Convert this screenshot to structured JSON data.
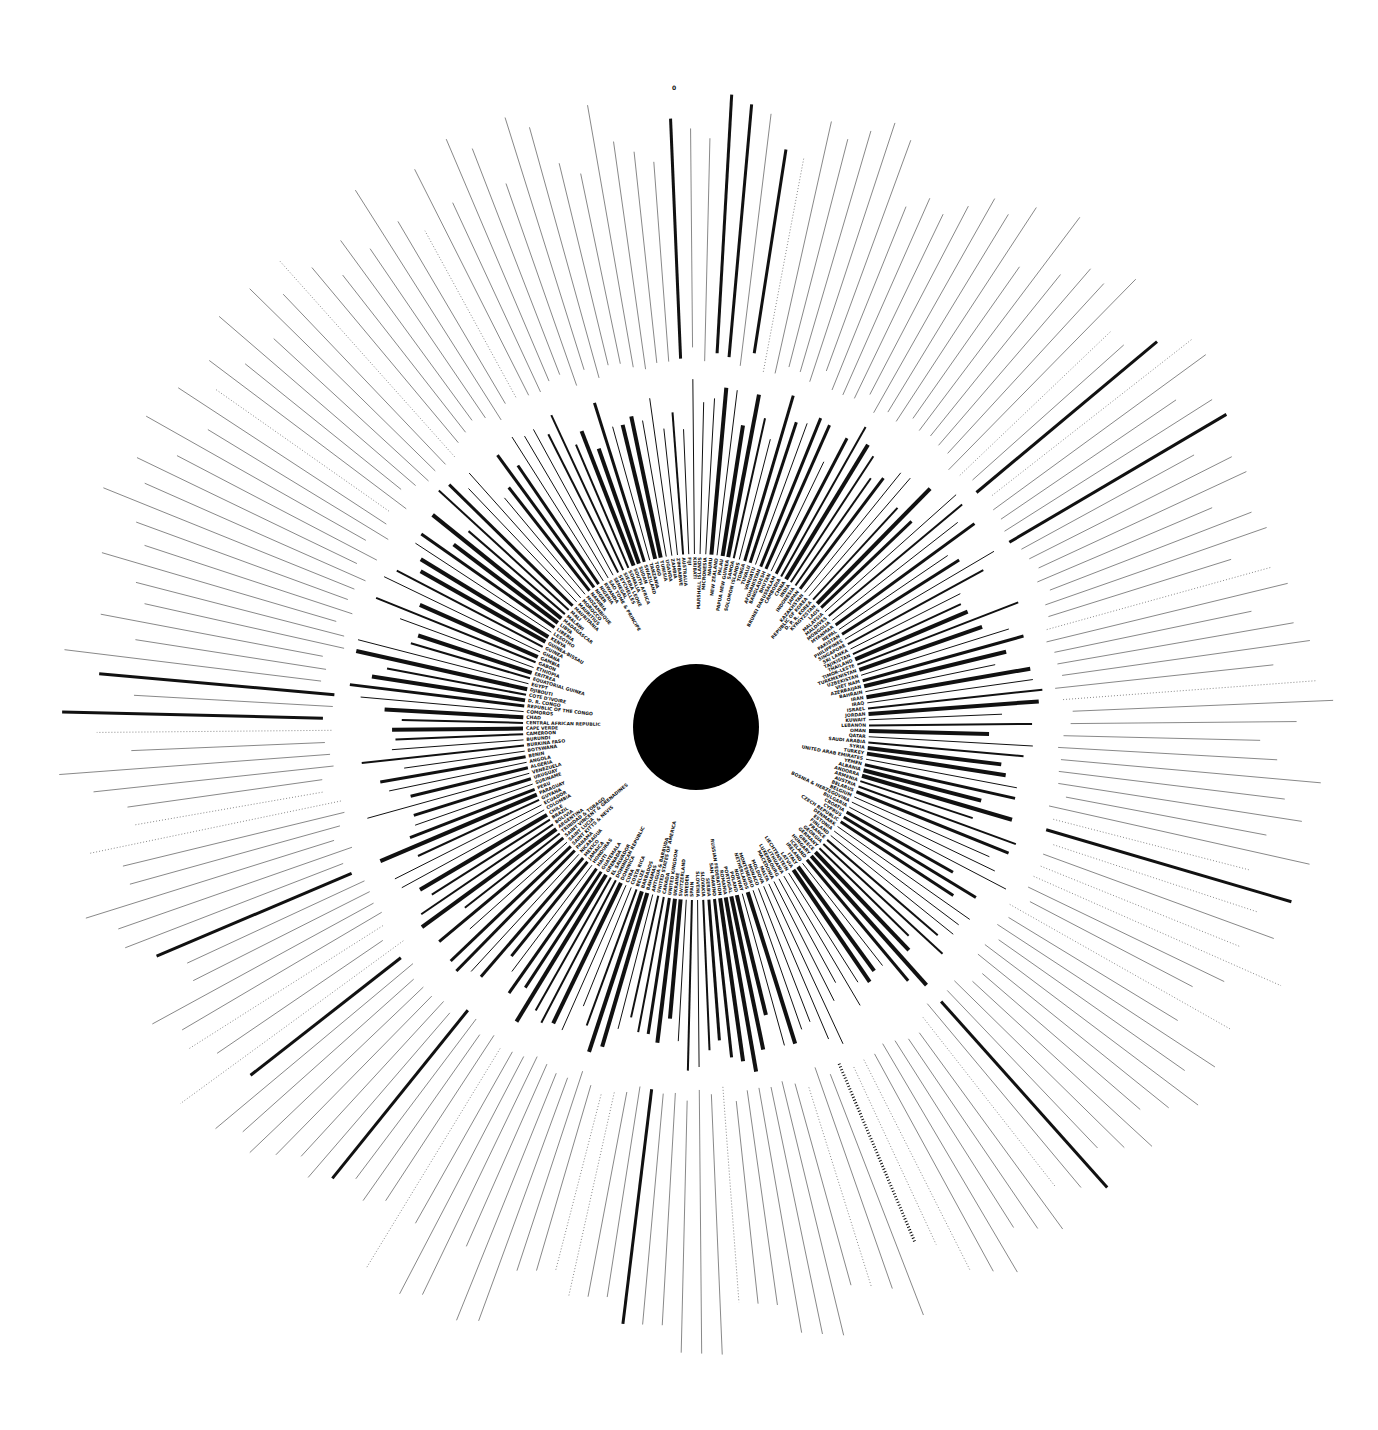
{
  "chart_data": {
    "type": "radial-bar",
    "title": "",
    "center": {
      "x": 696,
      "y": 727
    },
    "center_dot_radius": 63,
    "label_radius": 165,
    "inner_ring_radius": 350,
    "outer_radius": 640,
    "zero_label": "0",
    "colors": {
      "bar": "#111111",
      "thin": "#555555",
      "background": "#ffffff"
    },
    "regions": [
      {
        "name": "Asia-Pacific (top)",
        "countries": [
          "SAMOA",
          "SOLOMON ISLANDS",
          "TONGA",
          "TUVALU",
          "VANUATU",
          "AFGHANISTAN",
          "BANGLADESH",
          "BHUTAN",
          "BRUNEI DARUSSALAM",
          "CAMBODIA",
          "CHINA",
          "INDIA",
          "INDONESIA",
          "JAPAN",
          "KAZAKHSTAN",
          "REPUBLIC OF KOREA",
          "D. P. R. KOREA",
          "KYRGYZSTAN",
          "LAOS",
          "MALAYSIA",
          "MALDIVES",
          "MONGOLIA",
          "MYANMAR",
          "NEPAL",
          "PAKISTAN",
          "PHILIPPINES",
          "SINGAPORE",
          "SRI LANKA",
          "TAJIKISTAN",
          "THAILAND",
          "TIMOR-LESTE",
          "TURKMENISTAN",
          "UZBEKISTAN",
          "VIET NAM"
        ]
      },
      {
        "name": "Middle East",
        "countries": [
          "AZERBAIJAN",
          "BAHRAIN",
          "IRAN",
          "IRAQ",
          "ISRAEL",
          "JORDAN",
          "KUWAIT",
          "LEBANON",
          "OMAN",
          "QATAR",
          "SAUDI ARABIA",
          "SYRIA",
          "TURKEY",
          "UNITED ARAB EMIRATES",
          "YEMEN"
        ]
      },
      {
        "name": "Europe",
        "countries": [
          "ALBANIA",
          "ANDORRA",
          "ARMENIA",
          "AUSTRIA",
          "BELARUS",
          "BELGIUM",
          "BOSNIA & HERZEGOVINA",
          "BULGARIA",
          "CROATIA",
          "CYPRUS",
          "CZECH REPUBLIC",
          "DENMARK",
          "ESTONIA",
          "FINLAND",
          "FRANCE",
          "GEORGIA",
          "GERMANY",
          "GREECE",
          "HUNGARY",
          "ICELAND",
          "IRELAND",
          "ITALY",
          "LATVIA",
          "LIECHTENSTEIN",
          "LITHUANIA",
          "LUXEMBOURG",
          "MACEDONIA",
          "MALTA",
          "MOLDOVA",
          "MONACO",
          "MONTENEGRO",
          "NETHERLANDS",
          "NORWAY",
          "POLAND",
          "PORTUGAL",
          "ROMANIA",
          "RUSSIAN FEDERATION",
          "SAN MARINO",
          "SERBIA",
          "SLOVAKIA",
          "SLOVENIA",
          "SPAIN",
          "SWEDEN",
          "SWITZERLAND",
          "UKRAINE",
          "UNITED KINGDOM"
        ]
      },
      {
        "name": "Americas",
        "countries": [
          "CANADA",
          "UNITED STATES OF AMERICA",
          "ANTIGUA & BARBUDA",
          "BAHAMAS",
          "BARBADOS",
          "BELIZE",
          "COSTA RICA",
          "CUBA",
          "DOMINICA",
          "DOMINICAN REPUBLIC",
          "EL SALVADOR",
          "GRENADA",
          "GUATEMALA",
          "HAITI",
          "HONDURAS",
          "JAMAICA",
          "MEXICO",
          "NICARAGUA",
          "PANAMA",
          "SAINT KITTS & NEVIS",
          "SAINT LUCIA",
          "SAINT VINCENT & GRENADINES",
          "TRINIDAD & TOBAGO",
          "ARGENTINA",
          "BOLIVIA",
          "BRAZIL",
          "CHILE",
          "COLOMBIA",
          "ECUADOR",
          "GUYANA",
          "PARAGUAY",
          "PERU",
          "SURINAME",
          "URUGUAY",
          "VENEZUELA"
        ]
      },
      {
        "name": "Africa",
        "countries": [
          "ALGERIA",
          "ANGOLA",
          "BENIN",
          "BOTSWANA",
          "BURKINA FASO",
          "BURUNDI",
          "CAMEROON",
          "CAPE VERDE",
          "CENTRAL AFRICAN REPUBLIC",
          "CHAD",
          "COMOROS",
          "REPUBLIC OF THE CONGO",
          "D. R. CONGO",
          "COTE D'IVOIRE",
          "DJIBOUTI",
          "EGYPT",
          "EQUATORIAL GUINEA",
          "ERITREA",
          "ETHIOPIA",
          "GABON",
          "GAMBIA",
          "GHANA",
          "GUINEA",
          "GUINEA-BISSAU",
          "KENYA",
          "LESOTHO",
          "LIBERIA",
          "LIBYA",
          "MADAGASCAR",
          "MALAWI",
          "MALI",
          "MAURITANIA",
          "MAURITIUS",
          "MOROCCO",
          "MOZAMBIQUE",
          "NAMIBIA",
          "NIGER",
          "NIGERIA",
          "RWANDA",
          "SAO TOME & PRINCIPE",
          "SENEGAL",
          "SEYCHELLES",
          "SIERRA LEONE",
          "SOMALIA",
          "SOUTH AFRICA",
          "SUDAN",
          "SWAZILAND",
          "TANZANIA",
          "TOGO",
          "TUNISIA",
          "UGANDA",
          "ZAMBIA",
          "ZIMBABWE"
        ]
      },
      {
        "name": "Oceania",
        "countries": [
          "AUSTRALIA",
          "FIJI",
          "KIRIBATI",
          "MARSHALL ISLANDS",
          "MICRONESIA",
          "NAURU",
          "NEW ZEALAND",
          "PALAU",
          "PAPUA NEW GUINEA"
        ]
      }
    ]
  }
}
